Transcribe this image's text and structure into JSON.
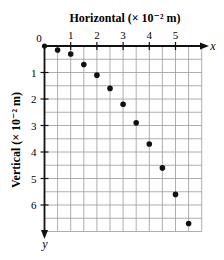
{
  "chart_data": {
    "type": "scatter",
    "title": "",
    "xlabel": "Horizontal (× 10⁻² m)",
    "ylabel": "Vertical (× 10⁻² m)",
    "x_axis_var": "x",
    "y_axis_var": "y",
    "origin_label": "0",
    "x_ticks": [
      "1",
      "2",
      "3",
      "4",
      "5"
    ],
    "y_ticks": [
      "1",
      "2",
      "3",
      "4",
      "5",
      "6"
    ],
    "xlim": [
      0,
      6
    ],
    "ylim": [
      0,
      7
    ],
    "y_direction": "down",
    "grid": true,
    "grid_step": 0.5,
    "legend": null,
    "series": [
      {
        "name": "trajectory",
        "x": [
          0,
          0.5,
          1.0,
          1.5,
          2.0,
          2.5,
          3.0,
          3.5,
          4.0,
          4.5,
          5.0,
          5.5
        ],
        "y": [
          0,
          0.15,
          0.3,
          0.7,
          1.1,
          1.6,
          2.2,
          2.9,
          3.7,
          4.6,
          5.6,
          6.7
        ]
      }
    ]
  }
}
